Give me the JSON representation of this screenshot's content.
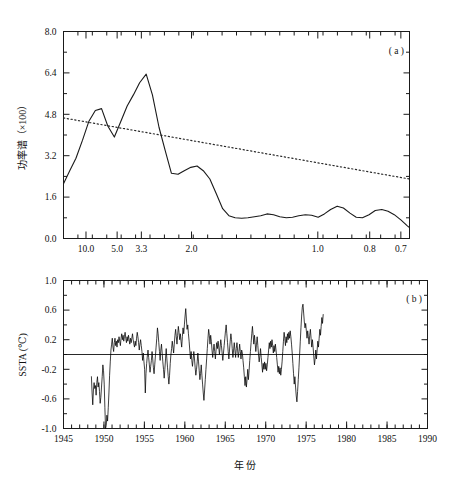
{
  "figure": {
    "background": "#ffffff",
    "ink_color": "#111111"
  },
  "chart_data": [
    {
      "type": "line",
      "panel_label": "( a )",
      "title": "",
      "xlabel": "",
      "ylabel": "功率谱（×100）",
      "ylim": [
        0.0,
        8.0
      ],
      "ytick_labels": [
        "0.0",
        "1.6",
        "3.2",
        "4.8",
        "6.4",
        "8.0"
      ],
      "ytick_values": [
        0.0,
        1.6,
        3.2,
        4.8,
        6.4,
        8.0
      ],
      "xtick_labels": [
        "10.0",
        "5.0",
        "3.3",
        "2.0",
        "1.0",
        "0.8",
        "0.7"
      ],
      "xtick_positions": [
        0.065,
        0.155,
        0.225,
        0.37,
        0.735,
        0.885,
        0.975
      ],
      "grid": false,
      "legend_position": "none",
      "x_axis_note": "period in years, decreasing left to right",
      "series": [
        {
          "name": "power-spectrum",
          "style": "solid",
          "x": [
            0.0,
            0.018,
            0.036,
            0.055,
            0.073,
            0.092,
            0.11,
            0.128,
            0.147,
            0.165,
            0.184,
            0.202,
            0.22,
            0.239,
            0.257,
            0.276,
            0.294,
            0.312,
            0.331,
            0.349,
            0.368,
            0.386,
            0.404,
            0.423,
            0.441,
            0.46,
            0.478,
            0.496,
            0.515,
            0.533,
            0.552,
            0.57,
            0.588,
            0.607,
            0.625,
            0.644,
            0.662,
            0.68,
            0.699,
            0.717,
            0.736,
            0.754,
            0.772,
            0.791,
            0.809,
            0.828,
            0.846,
            0.864,
            0.883,
            0.901,
            0.92,
            0.938,
            0.956,
            0.975,
            0.993,
            1.0
          ],
          "values": [
            2.12,
            2.62,
            3.1,
            3.8,
            4.52,
            4.95,
            5.02,
            4.35,
            3.92,
            4.5,
            5.12,
            5.55,
            6.02,
            6.35,
            5.55,
            4.3,
            3.4,
            2.52,
            2.48,
            2.62,
            2.75,
            2.8,
            2.62,
            2.3,
            1.75,
            1.15,
            0.88,
            0.8,
            0.78,
            0.8,
            0.84,
            0.88,
            0.95,
            0.92,
            0.84,
            0.8,
            0.82,
            0.88,
            0.92,
            0.9,
            0.82,
            0.95,
            1.12,
            1.25,
            1.18,
            0.98,
            0.82,
            0.8,
            0.92,
            1.08,
            1.12,
            1.05,
            0.92,
            0.72,
            0.5,
            0.42
          ]
        },
        {
          "name": "red-noise-confidence",
          "style": "dotted",
          "x": [
            0.0,
            1.0
          ],
          "values": [
            4.66,
            2.3
          ]
        }
      ]
    },
    {
      "type": "line",
      "panel_label": "( b )",
      "title": "",
      "xlabel": "年  份",
      "ylabel": "SSTA (℃)",
      "ylim": [
        -1.0,
        1.0
      ],
      "ytick_labels": [
        "-1.0",
        "-0.6",
        "-0.2",
        "0.2",
        "0.6",
        "1.0"
      ],
      "ytick_values": [
        -1.0,
        -0.6,
        -0.2,
        0.2,
        0.6,
        1.0
      ],
      "xlim": [
        1945,
        1990
      ],
      "xtick_labels": [
        "1945",
        "1950",
        "1955",
        "1960",
        "1965",
        "1970",
        "1975",
        "1980",
        "1985",
        "1990"
      ],
      "xtick_values": [
        1945,
        1950,
        1955,
        1960,
        1965,
        1970,
        1975,
        1980,
        1985,
        1990
      ],
      "grid": false,
      "legend_position": "none",
      "reference_line": 0.0,
      "series": [
        {
          "name": "SSTA",
          "style": "solid",
          "start_year": 1948.45,
          "step_years": 0.0833,
          "values": [
            -0.3,
            -0.52,
            -0.68,
            -0.48,
            -0.38,
            -0.46,
            -0.42,
            -0.55,
            -0.38,
            -0.3,
            -0.44,
            -0.38,
            -0.5,
            -0.66,
            -0.58,
            -0.44,
            -0.3,
            -0.14,
            -0.22,
            -0.4,
            -0.72,
            -1.0,
            -0.96,
            -0.82,
            -0.9,
            -0.72,
            -0.52,
            -0.28,
            -0.1,
            0.06,
            0.14,
            0.22,
            0.1,
            0.04,
            0.16,
            0.22,
            0.12,
            0.18,
            0.1,
            0.2,
            0.16,
            0.24,
            0.18,
            0.12,
            0.22,
            0.28,
            0.2,
            0.26,
            0.18,
            0.24,
            0.3,
            0.22,
            0.16,
            0.24,
            0.18,
            0.26,
            0.2,
            0.14,
            0.22,
            0.16,
            0.22,
            0.28,
            0.2,
            0.14,
            0.1,
            0.18,
            0.12,
            0.22,
            0.3,
            0.24,
            0.16,
            0.06,
            0.14,
            0.2,
            0.12,
            0.04,
            -0.08,
            0.02,
            -0.1,
            -0.2,
            -0.52,
            -0.26,
            -0.12,
            -0.02,
            0.06,
            -0.04,
            -0.14,
            -0.24,
            -0.16,
            -0.08,
            0.04,
            -0.06,
            -0.18,
            -0.26,
            -0.14,
            -0.02,
            0.1,
            0.22,
            0.36,
            0.28,
            0.16,
            0.04,
            -0.08,
            0.06,
            0.14,
            0.02,
            -0.1,
            -0.2,
            -0.32,
            -0.2,
            -0.06,
            0.08,
            -0.06,
            -0.18,
            -0.3,
            -0.4,
            -0.28,
            -0.12,
            0.0,
            0.08,
            0.18,
            0.1,
            0.02,
            0.14,
            0.26,
            0.34,
            0.24,
            0.14,
            0.26,
            0.38,
            0.3,
            0.2,
            0.28,
            0.18,
            0.1,
            0.24,
            0.36,
            0.28,
            0.4,
            0.52,
            0.62,
            0.48,
            0.34,
            0.4,
            0.28,
            0.18,
            0.06,
            -0.06,
            0.04,
            -0.08,
            -0.16,
            -0.06,
            0.04,
            -0.06,
            -0.18,
            -0.28,
            -0.2,
            -0.1,
            0.02,
            -0.1,
            -0.22,
            -0.34,
            -0.26,
            -0.14,
            -0.28,
            -0.4,
            -0.52,
            -0.62,
            -0.48,
            -0.34,
            -0.2,
            -0.06,
            0.08,
            0.22,
            0.34,
            0.26,
            0.14,
            0.26,
            0.18,
            0.06,
            -0.04,
            0.06,
            0.14,
            0.04,
            -0.06,
            0.06,
            0.16,
            0.08,
            0.18,
            0.1,
            0.0,
            0.1,
            0.2,
            0.12,
            0.02,
            -0.08,
            0.02,
            0.12,
            0.22,
            0.32,
            0.4,
            0.28,
            0.16,
            0.04,
            -0.06,
            0.06,
            0.18,
            0.28,
            0.2,
            0.08,
            -0.04,
            0.06,
            0.16,
            0.06,
            -0.04,
            0.08,
            0.16,
            0.06,
            -0.04,
            0.04,
            0.14,
            0.04,
            -0.06,
            0.06,
            0.02,
            -0.08,
            -0.18,
            -0.3,
            -0.42,
            -0.3,
            -0.44,
            -0.34,
            -0.2,
            -0.34,
            -0.22,
            -0.08,
            0.04,
            0.16,
            0.28,
            0.38,
            0.26,
            0.14,
            0.26,
            0.16,
            0.04,
            0.14,
            0.24,
            0.12,
            0.0,
            -0.1,
            -0.02,
            0.08,
            -0.04,
            -0.14,
            -0.24,
            -0.12,
            -0.2,
            -0.1,
            -0.2,
            -0.12,
            -0.22,
            -0.14,
            -0.04,
            0.06,
            0.16,
            0.08,
            0.18,
            0.1,
            0.2,
            0.12,
            0.02,
            0.12,
            0.04,
            0.14,
            0.06,
            -0.04,
            -0.14,
            -0.24,
            -0.16,
            -0.26,
            -0.18,
            -0.28,
            -0.2,
            -0.1,
            0.04,
            0.18,
            0.3,
            0.22,
            0.12,
            0.24,
            0.16,
            0.28,
            0.2,
            0.3,
            0.22,
            0.32,
            0.24,
            0.14,
            0.02,
            -0.12,
            -0.26,
            -0.4,
            -0.3,
            -0.44,
            -0.56,
            -0.64,
            -0.5,
            -0.34,
            -0.18,
            0.0,
            0.18,
            0.36,
            0.52,
            0.64,
            0.68,
            0.56,
            0.44,
            0.36,
            0.42,
            0.32,
            0.22,
            0.32,
            0.24,
            0.14,
            0.26,
            0.34,
            0.22,
            0.1,
            0.2,
            0.1,
            -0.02,
            -0.14,
            -0.06,
            0.06,
            -0.06,
            0.06,
            0.18,
            0.1,
            0.22,
            0.34,
            0.26,
            0.38,
            0.5,
            0.42,
            0.54
          ]
        }
      ]
    }
  ]
}
